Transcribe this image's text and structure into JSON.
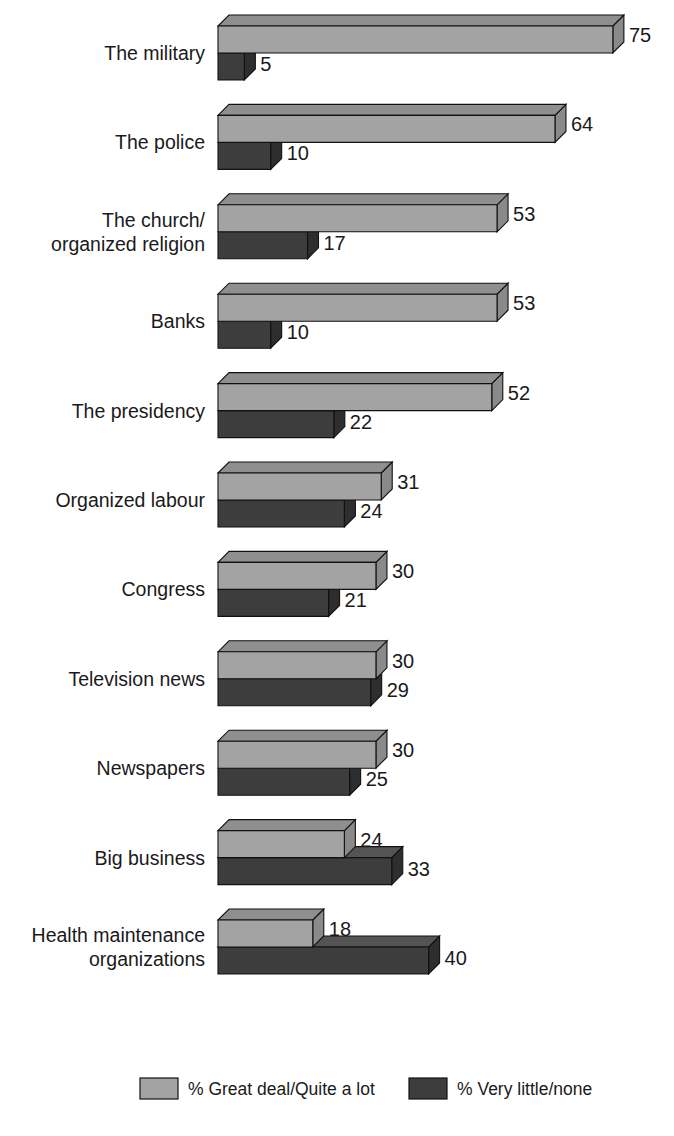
{
  "chart_data": {
    "type": "bar",
    "orientation": "horizontal",
    "style": "3d-grouped-horizontal-bars",
    "title": "",
    "subtitle": "",
    "xlabel": "",
    "ylabel": "",
    "xlim": [
      0,
      75
    ],
    "grid": false,
    "legend_position": "bottom",
    "categories": [
      "The military",
      "The police",
      "The church/ organized religion",
      "Banks",
      "The presidency",
      "Organized labour",
      "Congress",
      "Television news",
      "Newspapers",
      "Big business",
      "Health maintenance organizations"
    ],
    "category_lines": [
      [
        "The military"
      ],
      [
        "The police"
      ],
      [
        "The church/",
        "organized religion"
      ],
      [
        "Banks"
      ],
      [
        "The presidency"
      ],
      [
        "Organized labour"
      ],
      [
        "Congress"
      ],
      [
        "Television news"
      ],
      [
        "Newspapers"
      ],
      [
        "Big business"
      ],
      [
        "Health maintenance",
        "organizations"
      ]
    ],
    "series": [
      {
        "name": "% Great deal/Quite a lot",
        "color": "#a3a3a3",
        "values": [
          75,
          64,
          53,
          53,
          52,
          31,
          30,
          30,
          30,
          24,
          18
        ]
      },
      {
        "name": "% Very little/none",
        "color": "#3d3d3d",
        "values": [
          5,
          10,
          17,
          10,
          22,
          24,
          21,
          29,
          25,
          33,
          40
        ]
      }
    ]
  },
  "legend": {
    "items": [
      {
        "label": "% Great deal/Quite a lot",
        "color": "#a3a3a3"
      },
      {
        "label": "% Very little/none",
        "color": "#3d3d3d"
      }
    ]
  },
  "colors": {
    "light_face": "#a3a3a3",
    "light_top": "#8f8f8f",
    "light_side": "#8a8a8a",
    "dark_face": "#3d3d3d",
    "dark_top": "#545454",
    "dark_side": "#2e2e2e",
    "outline": "#111111",
    "background": "#ffffff",
    "text": "#1a1a1a"
  }
}
